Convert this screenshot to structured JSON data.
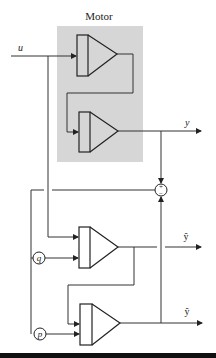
{
  "diagram": {
    "title": "Motor",
    "motor_box_color": "#d6d6d6",
    "signals": {
      "input": "u",
      "output": "y",
      "estimate_1": "ŷ",
      "estimate_2": "ŷ",
      "param_q": "q",
      "param_p": "p",
      "sum_plus": "+",
      "sum_minus": "−"
    },
    "blocks": [
      {
        "id": "motor-stage-1"
      },
      {
        "id": "motor-stage-2"
      },
      {
        "id": "model-stage-1"
      },
      {
        "id": "model-stage-2"
      }
    ]
  }
}
